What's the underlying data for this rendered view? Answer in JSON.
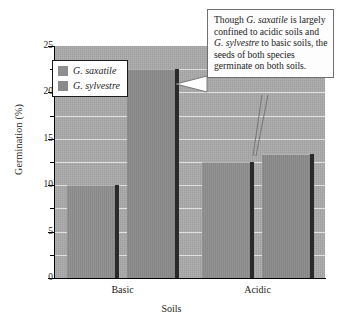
{
  "chart_data": {
    "type": "bar",
    "title": "",
    "xlabel": "Soils",
    "ylabel": "Germination (%)",
    "categories": [
      "Basic",
      "Acidic"
    ],
    "ylim": [
      0,
      25
    ],
    "yticks": [
      0,
      5,
      10,
      15,
      20,
      25
    ],
    "ytick_labels": [
      "0",
      "5",
      "10",
      "15",
      "20",
      "25"
    ],
    "minor_tick_step": 2.5,
    "grid": true,
    "grid_axis": "y",
    "legend_position": "upper left",
    "series": [
      {
        "name": "G. saxatile",
        "values": [
          10.0,
          12.5
        ],
        "color": "#8e8e8e"
      },
      {
        "name": "G. sylvestre",
        "values": [
          22.5,
          13.4
        ],
        "color": "#8a8a8a"
      }
    ],
    "annotations": [
      {
        "text": "Though G. saxatile is largely confined to acidic soils and G. sylvestre to basic soils, the seeds of both species germinate on both soils.",
        "points_to": [
          "Basic / G. sylvestre bar",
          "Acidic / G. sylvestre bar"
        ]
      }
    ],
    "plot_background": "#a9a9a9",
    "gridline_color": "#eceaea"
  },
  "axes": {
    "y_title": "Germination (%)",
    "x_title": "Soils",
    "y_labels": [
      "25",
      "20",
      "15",
      "10",
      "5",
      "0"
    ],
    "x_labels": [
      "Basic",
      "Acidic"
    ]
  },
  "legend": {
    "entries": [
      {
        "label": "G. saxatile"
      },
      {
        "label": "G. sylvestre"
      }
    ]
  },
  "callout": {
    "segments": [
      {
        "text": "Though ",
        "italic": false
      },
      {
        "text": "G. saxatile",
        "italic": true
      },
      {
        "text": " is largely confined to acidic soils and ",
        "italic": false
      },
      {
        "text": "G. sylvestre",
        "italic": true
      },
      {
        "text": " to basic soils, the seeds of both species germinate on both soils.",
        "italic": false
      }
    ],
    "plain_text": "Though G. saxatile is largely confined to acidic soils and G. sylvestre to basic soils, the seeds of both species germinate on both soils."
  }
}
